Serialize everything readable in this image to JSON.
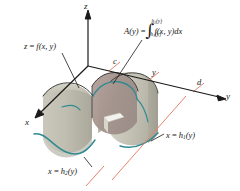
{
  "figure": {
    "name": "volume-by-cross-sections-diagram",
    "background_color": "#ffffff",
    "axes": {
      "z_label": "z",
      "x_label": "x",
      "y_label": "y",
      "axis_color": "#1a1a1a"
    },
    "ticks": {
      "c_label": "c",
      "y_label": "y",
      "d_label": "d",
      "tick_color": "#e8836f"
    },
    "labels": {
      "surface": {
        "lhs": "z",
        "eq": "=",
        "rhs_fn": "f",
        "rhs_args": "(x, y)",
        "full": "z = f(x, y)"
      },
      "area_function": {
        "lhs": "A(y)",
        "eq": "=",
        "integral_sign": "∫",
        "upper_limit_fn": "h",
        "upper_limit_sub": "2",
        "upper_limit_arg": "(y)",
        "lower_limit_fn": "h",
        "lower_limit_sub": "1",
        "lower_limit_arg": "(y)",
        "integrand": "f(x, y)",
        "differential": "dx",
        "full": "A(y) = ∫ h1(y) to h2(y) f(x, y) dx"
      },
      "boundary_upper": {
        "lhs": "x",
        "eq": "=",
        "fn": "h",
        "sub": "1",
        "arg": "(y)",
        "full": "x = h1(y)"
      },
      "boundary_lower": {
        "lhs": "x",
        "eq": "=",
        "fn": "h",
        "sub": "2",
        "arg": "(y)",
        "full": "x = h2(y)"
      }
    },
    "colors": {
      "solid_light": "#cfcec2",
      "solid_mid": "#b9b8ab",
      "solid_shadow": "#a8a79a",
      "cross_section": "#a99a96",
      "curve_teal": "#2f8a92",
      "tick_salmon": "#e8836f",
      "outline_dark": "#2a2a28"
    }
  }
}
